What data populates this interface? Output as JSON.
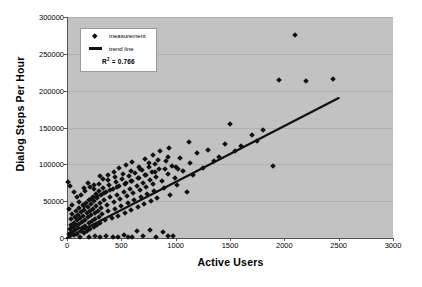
{
  "chart_data": {
    "type": "scatter",
    "title": "",
    "xlabel": "Active Users",
    "ylabel": "Dialog Steps Per Hour",
    "xlim": [
      0,
      3000
    ],
    "ylim": [
      0,
      300000
    ],
    "xticks": [
      0,
      500,
      1000,
      1500,
      2000,
      2500,
      3000
    ],
    "yticks": [
      0,
      50000,
      100000,
      150000,
      200000,
      250000,
      300000
    ],
    "grid": true,
    "legend_position": "top-left",
    "plot_background": "#c2c2c2",
    "marker_color": "#111111",
    "trend_color": "#111111",
    "legend": {
      "measurement_label": "measurement",
      "trend_label": "trend line",
      "r2_prefix": "R",
      "r2_sup": "2",
      "r2_value": "= 0.766"
    },
    "series": [
      {
        "name": "measurement",
        "marker": "diamond",
        "points": [
          [
            10,
            76000
          ],
          [
            15,
            40000
          ],
          [
            20,
            5000
          ],
          [
            25,
            12000
          ],
          [
            30,
            3000
          ],
          [
            35,
            18000
          ],
          [
            40,
            26000
          ],
          [
            45,
            8000
          ],
          [
            50,
            33000
          ],
          [
            55,
            15000
          ],
          [
            60,
            21000
          ],
          [
            65,
            4000
          ],
          [
            70,
            29000
          ],
          [
            75,
            11000
          ],
          [
            80,
            36000
          ],
          [
            85,
            17000
          ],
          [
            90,
            24000
          ],
          [
            95,
            6000
          ],
          [
            100,
            31000
          ],
          [
            105,
            13000
          ],
          [
            110,
            41000
          ],
          [
            115,
            19000
          ],
          [
            120,
            27000
          ],
          [
            125,
            9000
          ],
          [
            130,
            35000
          ],
          [
            135,
            22000
          ],
          [
            140,
            14000
          ],
          [
            145,
            45000
          ],
          [
            150,
            30000
          ],
          [
            155,
            7000
          ],
          [
            160,
            38000
          ],
          [
            165,
            25000
          ],
          [
            170,
            16000
          ],
          [
            175,
            48000
          ],
          [
            180,
            34000
          ],
          [
            185,
            10000
          ],
          [
            190,
            42000
          ],
          [
            195,
            28000
          ],
          [
            200,
            20000
          ],
          [
            205,
            52000
          ],
          [
            210,
            37000
          ],
          [
            215,
            12000
          ],
          [
            220,
            46000
          ],
          [
            225,
            31000
          ],
          [
            230,
            23000
          ],
          [
            235,
            56000
          ],
          [
            240,
            39000
          ],
          [
            245,
            15000
          ],
          [
            250,
            50000
          ],
          [
            255,
            34000
          ],
          [
            260,
            26000
          ],
          [
            265,
            60000
          ],
          [
            270,
            43000
          ],
          [
            275,
            18000
          ],
          [
            280,
            54000
          ],
          [
            285,
            37000
          ],
          [
            290,
            29000
          ],
          [
            295,
            64000
          ],
          [
            300,
            47000
          ],
          [
            305,
            21000
          ],
          [
            310,
            58000
          ],
          [
            315,
            41000
          ],
          [
            320,
            32000
          ],
          [
            330,
            68000
          ],
          [
            340,
            51000
          ],
          [
            350,
            24000
          ],
          [
            360,
            62000
          ],
          [
            370,
            45000
          ],
          [
            380,
            36000
          ],
          [
            390,
            72000
          ],
          [
            400,
            55000
          ],
          [
            410,
            27000
          ],
          [
            420,
            66000
          ],
          [
            430,
            49000
          ],
          [
            440,
            40000
          ],
          [
            450,
            76000
          ],
          [
            460,
            59000
          ],
          [
            470,
            30000
          ],
          [
            480,
            70000
          ],
          [
            490,
            53000
          ],
          [
            500,
            44000
          ],
          [
            510,
            80000
          ],
          [
            520,
            63000
          ],
          [
            530,
            34000
          ],
          [
            540,
            74000
          ],
          [
            550,
            57000
          ],
          [
            560,
            48000
          ],
          [
            570,
            84000
          ],
          [
            580,
            67000
          ],
          [
            590,
            38000
          ],
          [
            600,
            78000
          ],
          [
            610,
            61000
          ],
          [
            620,
            52000
          ],
          [
            630,
            88000
          ],
          [
            640,
            71000
          ],
          [
            650,
            42000
          ],
          [
            660,
            82000
          ],
          [
            670,
            65000
          ],
          [
            680,
            56000
          ],
          [
            690,
            92000
          ],
          [
            700,
            75000
          ],
          [
            710,
            46000
          ],
          [
            720,
            86000
          ],
          [
            730,
            69000
          ],
          [
            740,
            60000
          ],
          [
            750,
            96000
          ],
          [
            760,
            79000
          ],
          [
            770,
            50000
          ],
          [
            780,
            90000
          ],
          [
            790,
            73000
          ],
          [
            800,
            64000
          ],
          [
            810,
            100000
          ],
          [
            820,
            83000
          ],
          [
            830,
            54000
          ],
          [
            850,
            94000
          ],
          [
            870,
            77000
          ],
          [
            890,
            68000
          ],
          [
            910,
            104000
          ],
          [
            930,
            87000
          ],
          [
            950,
            58000
          ],
          [
            970,
            98000
          ],
          [
            990,
            81000
          ],
          [
            1010,
            72000
          ],
          [
            1040,
            108000
          ],
          [
            1070,
            91000
          ],
          [
            1100,
            62000
          ],
          [
            1130,
            102000
          ],
          [
            1160,
            85000
          ],
          [
            1200,
            115000
          ],
          [
            1250,
            95000
          ],
          [
            1300,
            120000
          ],
          [
            1350,
            105000
          ],
          [
            1400,
            110000
          ],
          [
            1450,
            128000
          ],
          [
            1500,
            155000
          ],
          [
            1550,
            118000
          ],
          [
            1600,
            125000
          ],
          [
            1700,
            140000
          ],
          [
            1750,
            132000
          ],
          [
            1800,
            147000
          ],
          [
            1900,
            98000
          ],
          [
            1950,
            215000
          ],
          [
            2100,
            275000
          ],
          [
            2200,
            213000
          ],
          [
            2450,
            216000
          ],
          [
            120,
            2000
          ],
          [
            200,
            1500
          ],
          [
            260,
            2500
          ],
          [
            300,
            1000
          ],
          [
            360,
            3000
          ],
          [
            420,
            2000
          ],
          [
            470,
            1500
          ],
          [
            520,
            3500
          ],
          [
            560,
            2000
          ],
          [
            600,
            1500
          ],
          [
            640,
            9000
          ],
          [
            700,
            2500
          ],
          [
            760,
            11000
          ],
          [
            820,
            2000
          ],
          [
            880,
            8000
          ],
          [
            930,
            3000
          ],
          [
            980,
            2500
          ],
          [
            30,
            70000
          ],
          [
            60,
            62000
          ],
          [
            90,
            55000
          ],
          [
            130,
            58000
          ],
          [
            170,
            64000
          ],
          [
            210,
            69000
          ],
          [
            250,
            66000
          ],
          [
            290,
            73000
          ],
          [
            330,
            80000
          ],
          [
            380,
            86000
          ],
          [
            430,
            90000
          ],
          [
            480,
            95000
          ],
          [
            540,
            99000
          ],
          [
            600,
            103000
          ],
          [
            660,
            96000
          ],
          [
            720,
            107000
          ],
          [
            790,
            112000
          ],
          [
            860,
            118000
          ],
          [
            940,
            122000
          ],
          [
            1020,
            94000
          ],
          [
            1120,
            130000
          ],
          [
            50,
            45000
          ],
          [
            110,
            49000
          ],
          [
            160,
            43000
          ],
          [
            220,
            53000
          ],
          [
            280,
            57000
          ],
          [
            340,
            61000
          ],
          [
            400,
            65000
          ],
          [
            460,
            69000
          ],
          [
            530,
            73000
          ],
          [
            590,
            77000
          ],
          [
            650,
            81000
          ],
          [
            730,
            85000
          ],
          [
            810,
            89000
          ],
          [
            900,
            93000
          ],
          [
            1000,
            97000
          ],
          [
            155,
            68000
          ],
          [
            195,
            75000
          ],
          [
            245,
            72000
          ],
          [
            305,
            84000
          ],
          [
            375,
            79000
          ],
          [
            445,
            83000
          ],
          [
            515,
            87000
          ],
          [
            585,
            91000
          ],
          [
            670,
            94000
          ],
          [
            755,
            102000
          ],
          [
            840,
            106000
          ],
          [
            925,
            110000
          ]
        ]
      }
    ],
    "trend_line": {
      "name": "trend line",
      "x_start": 0,
      "y_start": 0,
      "x_end": 2500,
      "y_end": 190000,
      "r_squared": 0.766
    }
  }
}
